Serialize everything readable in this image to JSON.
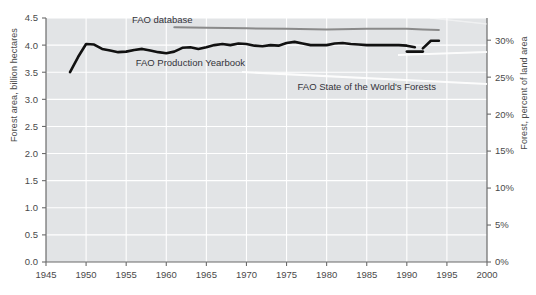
{
  "chart_data": {
    "type": "line",
    "title": "",
    "subtitle": "",
    "xlabel": "",
    "ylabel": "Forest area, billion hectares",
    "ylabel_right": "Forest, percent of land area",
    "xlim": [
      1945,
      2000
    ],
    "ylim": [
      0.0,
      4.5
    ],
    "ylim_right": [
      0,
      33.0
    ],
    "grid": true,
    "legend_position": "inline-annotations",
    "xticks": [
      1945,
      1950,
      1955,
      1960,
      1965,
      1970,
      1975,
      1980,
      1985,
      1990,
      1995,
      2000
    ],
    "xticklabels": [
      "1945",
      "1950",
      "1955",
      "1960",
      "1965",
      "1970",
      "1975",
      "1980",
      "1985",
      "1990",
      "1995",
      "2000"
    ],
    "yticks": [
      0.0,
      0.5,
      1.0,
      1.5,
      2.0,
      2.5,
      3.0,
      3.5,
      4.0,
      4.5
    ],
    "yticklabels": [
      "0.0",
      "0.5",
      "1.0",
      "1.5",
      "2.0",
      "2.5",
      "3.0",
      "3.5",
      "4.0",
      "4.5"
    ],
    "yticks_right": [
      0,
      5,
      10,
      15,
      20,
      25,
      30
    ],
    "yticklabels_right": [
      "0%",
      "5%",
      "10%",
      "15%",
      "20%",
      "25%",
      "30%"
    ],
    "annotations": [
      {
        "text": "FAO database",
        "x": 1959.5,
        "y": 4.4
      },
      {
        "text": "FAO Production Yearbook",
        "x": 1963.0,
        "y": 3.62
      },
      {
        "text": "FAO State of the World's Forests",
        "x": 1985.0,
        "y": 3.18
      }
    ],
    "series": [
      {
        "name": "FAO Production Yearbook",
        "color": "#111111",
        "x": [
          1948,
          1949,
          1950,
          1951,
          1952,
          1953,
          1954,
          1955,
          1956,
          1957,
          1958,
          1959,
          1960,
          1961,
          1962,
          1963,
          1964,
          1965,
          1966,
          1967,
          1968,
          1969,
          1970,
          1971,
          1972,
          1973,
          1974,
          1975,
          1976,
          1977,
          1978,
          1979,
          1980,
          1981,
          1982,
          1983,
          1984,
          1985,
          1986,
          1987,
          1988,
          1989,
          1990,
          1991
        ],
        "values": [
          3.5,
          3.78,
          4.02,
          4.01,
          3.93,
          3.9,
          3.87,
          3.88,
          3.91,
          3.93,
          3.9,
          3.87,
          3.85,
          3.88,
          3.95,
          3.96,
          3.93,
          3.96,
          4.0,
          4.02,
          4.0,
          4.03,
          4.02,
          3.99,
          3.98,
          4.0,
          3.99,
          4.04,
          4.06,
          4.03,
          4.0,
          4.0,
          4.0,
          4.03,
          4.04,
          4.02,
          4.01,
          4.0,
          4.0,
          4.0,
          4.0,
          4.0,
          3.99,
          3.96
        ]
      },
      {
        "name": "FAO State of the World's Forests",
        "color": "#111111",
        "x": [
          1990,
          1992
        ],
        "values": [
          3.88,
          3.88
        ]
      },
      {
        "name": "FAO State of the World's Forests (revised)",
        "color": "#111111",
        "x": [
          1992,
          1993,
          1994
        ],
        "values": [
          3.94,
          4.08,
          4.08
        ]
      },
      {
        "name": "FAO database",
        "color": "#8a8a8a",
        "x": [
          1961,
          1965,
          1970,
          1975,
          1980,
          1985,
          1990,
          1992,
          1994
        ],
        "values": [
          4.33,
          4.32,
          4.31,
          4.3,
          4.29,
          4.3,
          4.3,
          4.29,
          4.28
        ]
      }
    ]
  },
  "axes": {
    "plot_bg": "#e2e4e6",
    "grid_color": "#ffffff",
    "axis_color": "#6b6b6b"
  }
}
